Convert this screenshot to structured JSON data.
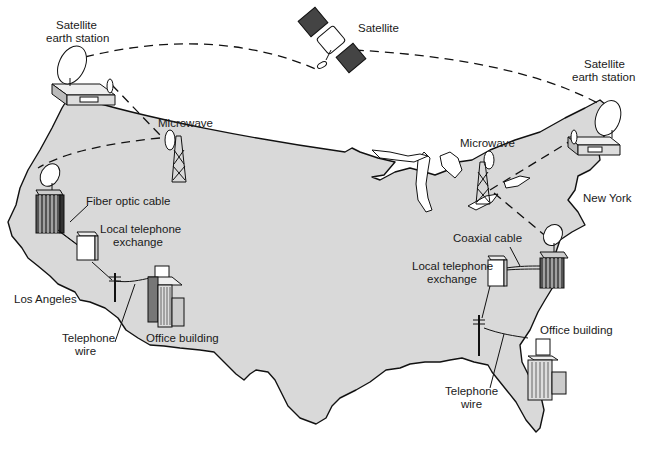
{
  "diagram": {
    "labels": {
      "satellite": "Satellite",
      "earth_station_west_line1": "Satellite",
      "earth_station_west_line2": "earth station",
      "earth_station_east_line1": "Satellite",
      "earth_station_east_line2": "earth station",
      "microwave_west": "Microwave",
      "microwave_east": "Microwave",
      "fiber_optic_cable": "Fiber optic cable",
      "local_exchange_west_line1": "Local telephone",
      "local_exchange_west_line2": "exchange",
      "los_angeles": "Los Angeles",
      "telephone_wire_west_line1": "Telephone",
      "telephone_wire_west_line2": "wire",
      "office_building_west": "Office building",
      "new_york": "New York",
      "coaxial_cable": "Coaxial cable",
      "local_exchange_east_line1": "Local telephone",
      "local_exchange_east_line2": "exchange",
      "office_building_east": "Office building",
      "telephone_wire_east_line1": "Telephone",
      "telephone_wire_east_line2": "wire"
    },
    "colors": {
      "land": "#d9d9d9",
      "ink": "#111111",
      "background": "#ffffff"
    }
  }
}
